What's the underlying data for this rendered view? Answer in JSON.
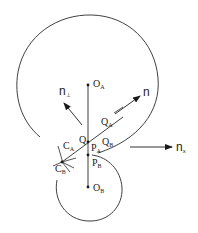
{
  "diagram": {
    "type": "contact-geometry",
    "bodies": [
      {
        "name": "A",
        "center_label": "O",
        "center_sub": "A",
        "shape": "large circle (open at lower-left)"
      },
      {
        "name": "B",
        "center_label": "O",
        "center_sub": "B",
        "shape": "small circle (open at upper-left)"
      }
    ],
    "labels": {
      "O_A": {
        "main": "O",
        "sub": "A"
      },
      "O_B": {
        "main": "O",
        "sub": "B"
      },
      "Q": {
        "main": "Q",
        "sub": ""
      },
      "Q_A": {
        "main": "Q",
        "sub": "A"
      },
      "Q_B": {
        "main": "Q",
        "sub": "B"
      },
      "P_A": {
        "main": "P",
        "sub": "A"
      },
      "P_B": {
        "main": "P",
        "sub": "B"
      },
      "C_A": {
        "main": "C",
        "sub": "A"
      },
      "C_B": {
        "main": "C",
        "sub": "B"
      },
      "n": {
        "main": "n",
        "sub": ""
      },
      "n_perp": {
        "main": "n",
        "sub": "⊥"
      },
      "n_x": {
        "main": "n",
        "sub": "x"
      }
    },
    "vectors": [
      {
        "name": "n",
        "direction": "up-right along contact line"
      },
      {
        "name": "n_perp",
        "direction": "up-left, perpendicular to n"
      },
      {
        "name": "n_x",
        "direction": "horizontal right"
      }
    ],
    "stroke_color": "#2a2a2a",
    "background": "#ffffff"
  }
}
